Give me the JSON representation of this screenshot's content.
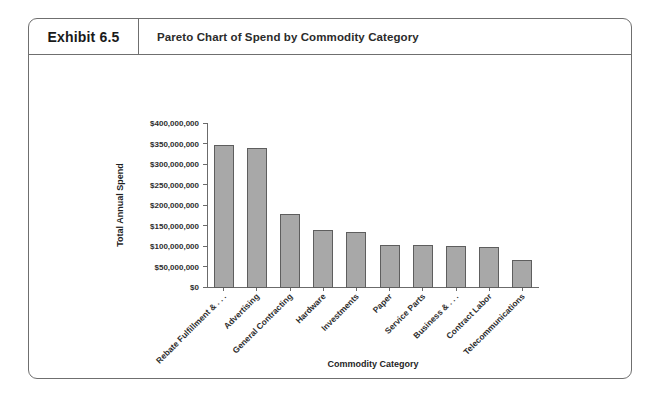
{
  "exhibit": {
    "number": "Exhibit 6.5",
    "title": "Pareto Chart of Spend by Commodity Category"
  },
  "colors": {
    "frame_border": "#6f6f6f",
    "bar_fill": "#a8a8a8",
    "bar_stroke": "#5e5e5e",
    "axis": "#6b6b6b",
    "text": "#2e2e2e",
    "background": "#ffffff"
  },
  "chart_data": {
    "type": "bar",
    "title": "Pareto Chart of Spend by Commodity Category",
    "xlabel": "Commodity Category",
    "ylabel": "Total Annual Spend",
    "ylim": [
      0,
      400000000
    ],
    "ytick_step": 50000000,
    "grid": false,
    "legend": false,
    "ytick_labels": [
      "$0",
      "$50,000,000",
      "$100,000,000",
      "$150,000,000",
      "$200,000,000",
      "$250,000,000",
      "$300,000,000",
      "$350,000,000",
      "$400,000,000"
    ],
    "ytick_values": [
      0,
      50000000,
      100000000,
      150000000,
      200000000,
      250000000,
      300000000,
      350000000,
      400000000
    ],
    "categories": [
      "Rebate Fulfillment & . . .",
      "Advertising",
      "General Contracting",
      "Hardware",
      "Investments",
      "Paper",
      "Service Parts",
      "Business & . . .",
      "Contract Labor",
      "Telecommunications"
    ],
    "values": [
      345000000,
      338000000,
      177000000,
      137000000,
      132000000,
      102000000,
      101000000,
      98000000,
      96000000,
      65000000
    ]
  }
}
